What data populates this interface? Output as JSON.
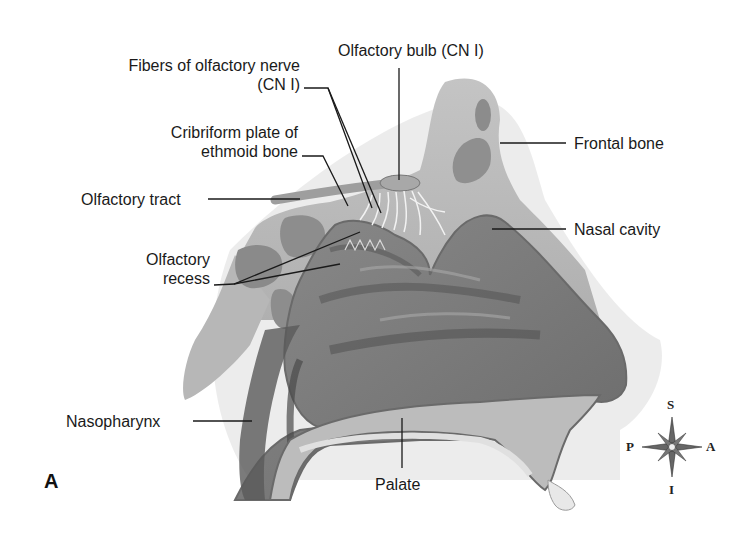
{
  "figure": {
    "panel_letter": "A",
    "labels": {
      "fibers_line1": "Fibers of olfactory nerve",
      "fibers_line2": "(CN I)",
      "bulb": "Olfactory bulb (CN I)",
      "cribriform_line1": "Cribriform plate of",
      "cribriform_line2": "ethmoid bone",
      "tract": "Olfactory tract",
      "recess_line1": "Olfactory",
      "recess_line2": "recess",
      "frontal": "Frontal bone",
      "nasal_cavity": "Nasal cavity",
      "nasopharynx": "Nasopharynx",
      "palate": "Palate"
    },
    "compass": {
      "superior": "S",
      "inferior": "I",
      "posterior": "P",
      "anterior": "A"
    },
    "colors": {
      "bone": "#b9b9b9",
      "cavity": "#7d7d7d",
      "cavity_dark": "#555555",
      "outline": "#6a6a6a",
      "text": "#1a1a1a"
    }
  }
}
